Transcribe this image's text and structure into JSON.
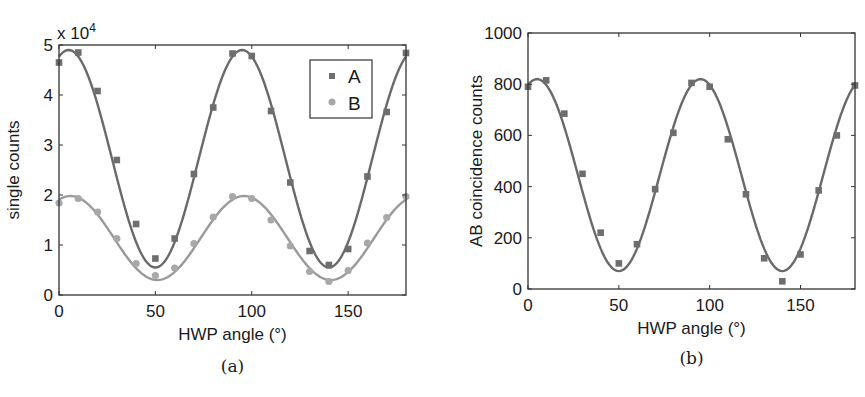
{
  "colors": {
    "series_a": "#6e6e6e",
    "series_b": "#a8a8a8",
    "axis": "#333333",
    "fit_line_b": "#9a9a9a",
    "fit_line_a": "#6a6a6a"
  },
  "panels": [
    {
      "caption": "(a)",
      "xlabel": "HWP angle (°)",
      "ylabel": "single counts",
      "multiplier": "x 10",
      "multiplier_exp": "4",
      "legend": [
        "A",
        "B"
      ]
    },
    {
      "caption": "(b)",
      "xlabel": "HWP angle (°)",
      "ylabel": "AB coincidence counts"
    }
  ],
  "chart_data": [
    {
      "type": "scatter",
      "title": "",
      "caption": "(a)",
      "xlabel": "HWP angle (°)",
      "ylabel": "single counts",
      "y_multiplier": "x 10^4",
      "xlim": [
        0,
        180
      ],
      "ylim": [
        0,
        5
      ],
      "xticks": [
        0,
        50,
        100,
        150
      ],
      "yticks": [
        0,
        1,
        2,
        3,
        4,
        5
      ],
      "grid": false,
      "legend_position": "upper right",
      "x": [
        0,
        10,
        20,
        30,
        40,
        50,
        60,
        70,
        80,
        90,
        100,
        110,
        120,
        130,
        140,
        150,
        160,
        170,
        180
      ],
      "series": [
        {
          "name": "A",
          "marker": "square",
          "values": [
            4.65,
            4.85,
            4.08,
            2.7,
            1.42,
            0.73,
            1.13,
            2.42,
            3.75,
            4.83,
            4.78,
            3.68,
            2.25,
            0.88,
            0.6,
            0.92,
            2.37,
            3.66,
            4.84
          ],
          "fit": {
            "form": "sinusoid",
            "max": 4.9,
            "min": 0.55,
            "period_deg": 90,
            "peak_deg": 5
          }
        },
        {
          "name": "B",
          "marker": "circle",
          "values": [
            1.84,
            1.93,
            1.66,
            1.13,
            0.63,
            0.39,
            0.54,
            1.03,
            1.56,
            1.97,
            1.93,
            1.5,
            0.98,
            0.47,
            0.27,
            0.49,
            1.04,
            1.55,
            1.97
          ],
          "fit": {
            "form": "sinusoid",
            "max": 1.98,
            "min": 0.3,
            "period_deg": 90,
            "peak_deg": 6
          }
        }
      ]
    },
    {
      "type": "scatter",
      "title": "",
      "caption": "(b)",
      "xlabel": "HWP angle (°)",
      "ylabel": "AB coincidence counts",
      "xlim": [
        0,
        180
      ],
      "ylim": [
        0,
        1000
      ],
      "xticks": [
        0,
        50,
        100,
        150
      ],
      "yticks": [
        0,
        200,
        400,
        600,
        800,
        1000
      ],
      "grid": false,
      "x": [
        0,
        10,
        20,
        30,
        40,
        50,
        60,
        70,
        80,
        90,
        100,
        110,
        120,
        130,
        140,
        150,
        160,
        170,
        180
      ],
      "series": [
        {
          "name": "AB coincidences",
          "marker": "square",
          "values": [
            790,
            815,
            685,
            450,
            220,
            100,
            175,
            390,
            610,
            805,
            790,
            585,
            370,
            120,
            30,
            135,
            385,
            600,
            795
          ],
          "fit": {
            "form": "sinusoid",
            "max": 820,
            "min": 70,
            "period_deg": 90,
            "peak_deg": 5
          }
        }
      ]
    }
  ]
}
